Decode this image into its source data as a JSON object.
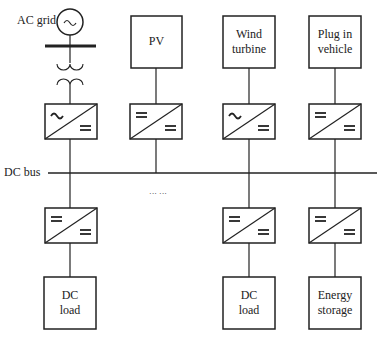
{
  "diagram": {
    "labels": {
      "ac_grid": "AC grid",
      "dc_bus": "DC bus",
      "ellipsis": "··· ···"
    },
    "sources": [
      {
        "id": "pv",
        "line1": "PV",
        "line2": ""
      },
      {
        "id": "wind",
        "line1": "Wind",
        "line2": "turbine"
      },
      {
        "id": "ev",
        "line1": "Plug in",
        "line2": "vehicle"
      }
    ],
    "loads": [
      {
        "id": "dc-load-1",
        "line1": "DC",
        "line2": "load"
      },
      {
        "id": "dc-load-2",
        "line1": "DC",
        "line2": "load"
      },
      {
        "id": "storage",
        "line1": "Energy",
        "line2": "storage"
      }
    ],
    "converters": [
      {
        "id": "grid-conv",
        "type": "AC/DC"
      },
      {
        "id": "pv-conv",
        "type": "DC/DC"
      },
      {
        "id": "wind-conv",
        "type": "AC/DC"
      },
      {
        "id": "ev-conv",
        "type": "DC/DC"
      },
      {
        "id": "load1-conv",
        "type": "DC/DC"
      },
      {
        "id": "load2-conv",
        "type": "DC/DC"
      },
      {
        "id": "storage-conv",
        "type": "DC/DC"
      }
    ],
    "colors": {
      "stroke": "#222222",
      "background": "#ffffff"
    }
  }
}
